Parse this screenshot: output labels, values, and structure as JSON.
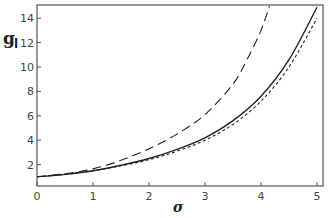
{
  "chart_data": {
    "type": "line",
    "title": "",
    "xlabel": "σ",
    "ylabel": "g",
    "ylabel_subscript": "l",
    "xlim": [
      0,
      5.1
    ],
    "ylim": [
      0.2,
      15.1
    ],
    "xticks": [
      0,
      1,
      2,
      3,
      4,
      5
    ],
    "yticks": [
      2,
      4,
      6,
      8,
      10,
      12,
      14
    ],
    "grid": false,
    "legend": null,
    "series": [
      {
        "name": "solid",
        "style": "solid",
        "x": [
          0,
          0.5,
          1,
          1.5,
          2,
          2.5,
          3,
          3.5,
          4,
          4.5,
          5
        ],
        "y": [
          1.0,
          1.2,
          1.5,
          1.95,
          2.5,
          3.25,
          4.2,
          5.6,
          7.6,
          10.6,
          14.9
        ]
      },
      {
        "name": "short-dashed",
        "style": "short-dash",
        "x": [
          0,
          0.5,
          1,
          1.5,
          2,
          2.5,
          3,
          3.5,
          4,
          4.5,
          5
        ],
        "y": [
          1.0,
          1.2,
          1.5,
          1.9,
          2.4,
          3.1,
          4.0,
          5.3,
          7.2,
          10.0,
          14.0
        ]
      },
      {
        "name": "long-dashed",
        "style": "long-dash",
        "x": [
          0,
          0.5,
          1,
          1.5,
          2,
          2.5,
          3,
          3.5,
          3.75,
          4.0,
          4.15
        ],
        "y": [
          1.0,
          1.25,
          1.65,
          2.35,
          3.3,
          4.5,
          6.1,
          8.6,
          10.6,
          13.0,
          15.0
        ]
      }
    ]
  },
  "colors": {
    "axis": "#555555",
    "line": "#222222",
    "background": "#ffffff"
  }
}
